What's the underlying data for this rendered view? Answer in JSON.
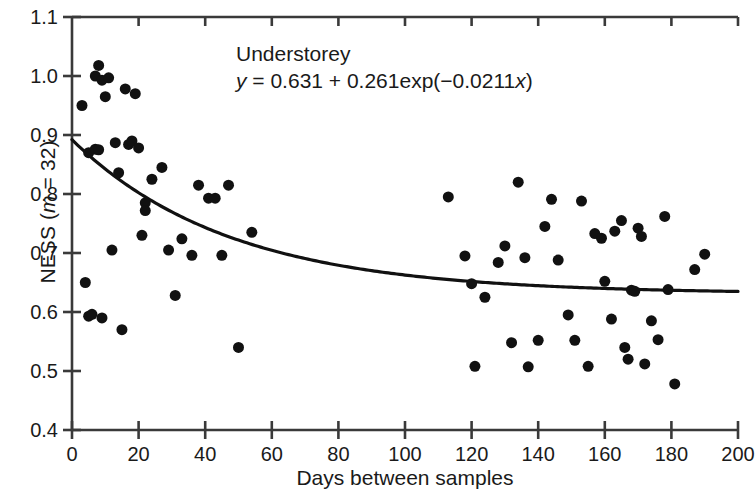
{
  "chart_data": {
    "type": "scatter",
    "title": "",
    "xlabel": "Days between samples",
    "ylabel": "NESS (m = 32)",
    "ylabel_prefix": "NESS (",
    "ylabel_italic": "m",
    "ylabel_suffix": " = 32)",
    "xlim": [
      0,
      200
    ],
    "ylim": [
      0.4,
      1.1
    ],
    "xticks": [
      0,
      20,
      40,
      60,
      80,
      100,
      120,
      140,
      160,
      180,
      200
    ],
    "yticks": [
      0.4,
      0.5,
      0.6,
      0.7,
      0.8,
      0.9,
      1.0,
      1.1
    ],
    "xtick_labels": [
      "0",
      "20",
      "40",
      "60",
      "80",
      "100",
      "120",
      "140",
      "160",
      "180",
      "200"
    ],
    "ytick_labels": [
      "0.4",
      "0.5",
      "0.6",
      "0.7",
      "0.8",
      "0.9",
      "1.0",
      "1.1"
    ],
    "grid": false,
    "legend": null,
    "marker_color": "#111111",
    "marker_size": 11,
    "line_color": "#111111",
    "line_width": 3.2,
    "annotations": [
      {
        "name": "series-label",
        "text": "Understorey"
      },
      {
        "name": "fit-equation",
        "text": "y = 0.631 + 0.261exp(-0.0211x)"
      }
    ],
    "fit": {
      "model": "exponential-decay",
      "equation_display": "y = 0.631 + 0.261exp(−0.0211x)",
      "asymptote": 0.631,
      "amplitude": 0.261,
      "rate": -0.0211,
      "x_start": 0,
      "x_end": 200
    },
    "points": [
      {
        "x": 3,
        "y": 0.95
      },
      {
        "x": 4,
        "y": 0.65
      },
      {
        "x": 5,
        "y": 0.87
      },
      {
        "x": 5,
        "y": 0.593
      },
      {
        "x": 6,
        "y": 0.596
      },
      {
        "x": 7,
        "y": 1.0
      },
      {
        "x": 7,
        "y": 0.876
      },
      {
        "x": 8,
        "y": 1.018
      },
      {
        "x": 8,
        "y": 0.875
      },
      {
        "x": 9,
        "y": 0.993
      },
      {
        "x": 9,
        "y": 0.59
      },
      {
        "x": 10,
        "y": 0.965
      },
      {
        "x": 11,
        "y": 0.997
      },
      {
        "x": 12,
        "y": 0.705
      },
      {
        "x": 13,
        "y": 0.887
      },
      {
        "x": 14,
        "y": 0.836
      },
      {
        "x": 15,
        "y": 0.57
      },
      {
        "x": 16,
        "y": 0.978
      },
      {
        "x": 17,
        "y": 0.884
      },
      {
        "x": 18,
        "y": 0.89
      },
      {
        "x": 19,
        "y": 0.97
      },
      {
        "x": 20,
        "y": 0.878
      },
      {
        "x": 21,
        "y": 0.73
      },
      {
        "x": 22,
        "y": 0.785
      },
      {
        "x": 22,
        "y": 0.772
      },
      {
        "x": 24,
        "y": 0.825
      },
      {
        "x": 27,
        "y": 0.845
      },
      {
        "x": 29,
        "y": 0.705
      },
      {
        "x": 31,
        "y": 0.628
      },
      {
        "x": 33,
        "y": 0.724
      },
      {
        "x": 36,
        "y": 0.696
      },
      {
        "x": 38,
        "y": 0.815
      },
      {
        "x": 41,
        "y": 0.793
      },
      {
        "x": 43,
        "y": 0.793
      },
      {
        "x": 45,
        "y": 0.696
      },
      {
        "x": 47,
        "y": 0.815
      },
      {
        "x": 50,
        "y": 0.54
      },
      {
        "x": 54,
        "y": 0.735
      },
      {
        "x": 113,
        "y": 0.795
      },
      {
        "x": 118,
        "y": 0.695
      },
      {
        "x": 120,
        "y": 0.648
      },
      {
        "x": 121,
        "y": 0.508
      },
      {
        "x": 124,
        "y": 0.625
      },
      {
        "x": 128,
        "y": 0.684
      },
      {
        "x": 130,
        "y": 0.712
      },
      {
        "x": 132,
        "y": 0.548
      },
      {
        "x": 134,
        "y": 0.82
      },
      {
        "x": 136,
        "y": 0.692
      },
      {
        "x": 137,
        "y": 0.507
      },
      {
        "x": 140,
        "y": 0.552
      },
      {
        "x": 142,
        "y": 0.745
      },
      {
        "x": 144,
        "y": 0.791
      },
      {
        "x": 146,
        "y": 0.688
      },
      {
        "x": 149,
        "y": 0.595
      },
      {
        "x": 151,
        "y": 0.552
      },
      {
        "x": 153,
        "y": 0.788
      },
      {
        "x": 155,
        "y": 0.508
      },
      {
        "x": 157,
        "y": 0.733
      },
      {
        "x": 159,
        "y": 0.725
      },
      {
        "x": 160,
        "y": 0.652
      },
      {
        "x": 162,
        "y": 0.588
      },
      {
        "x": 163,
        "y": 0.737
      },
      {
        "x": 165,
        "y": 0.755
      },
      {
        "x": 166,
        "y": 0.54
      },
      {
        "x": 167,
        "y": 0.52
      },
      {
        "x": 168,
        "y": 0.637
      },
      {
        "x": 169,
        "y": 0.635
      },
      {
        "x": 170,
        "y": 0.742
      },
      {
        "x": 171,
        "y": 0.728
      },
      {
        "x": 172,
        "y": 0.512
      },
      {
        "x": 174,
        "y": 0.585
      },
      {
        "x": 176,
        "y": 0.553
      },
      {
        "x": 178,
        "y": 0.762
      },
      {
        "x": 179,
        "y": 0.638
      },
      {
        "x": 181,
        "y": 0.478
      },
      {
        "x": 187,
        "y": 0.672
      },
      {
        "x": 190,
        "y": 0.698
      }
    ]
  }
}
